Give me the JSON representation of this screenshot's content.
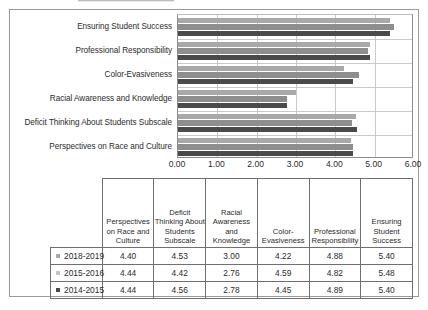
{
  "chart_data": {
    "type": "bar",
    "orientation": "horizontal",
    "title": "",
    "xlabel": "",
    "ylabel": "",
    "xlim": [
      0.0,
      6.0
    ],
    "xticks": [
      "0.00",
      "1.00",
      "2.00",
      "3.00",
      "4.00",
      "5.00",
      "6.00"
    ],
    "grid": true,
    "legend_position": "table-first-column",
    "categories": [
      "Perspectives on Race and Culture",
      "Deficit Thinking About Students Subscale",
      "Racial Awareness and Knowledge",
      "Color-Evasiveness",
      "Professional Responsibility",
      "Ensuring Student Success"
    ],
    "series": [
      {
        "name": "2018-2019",
        "color": "#a9a9a9",
        "values": [
          4.4,
          4.53,
          3.0,
          4.22,
          4.88,
          5.4
        ]
      },
      {
        "name": "2015-2016",
        "color": "#8e8e8e",
        "values": [
          4.44,
          4.42,
          2.76,
          4.59,
          4.82,
          5.48
        ]
      },
      {
        "name": "2014-2015",
        "color": "#4a4a4a",
        "values": [
          4.44,
          4.56,
          2.78,
          4.45,
          4.89,
          5.4
        ]
      }
    ]
  },
  "chart": {
    "category_labels": [
      "Ensuring Student Success",
      "Professional Responsibility",
      "Color-Evasiveness",
      "Racial Awareness and Knowledge",
      "Deficit Thinking About Students Subscale",
      "Perspectives on Race and Culture"
    ],
    "axis_ticks": [
      "0.00",
      "1.00",
      "2.00",
      "3.00",
      "4.00",
      "5.00",
      "6.00"
    ]
  },
  "table": {
    "corner_label": "",
    "headers": [
      "Perspectives on Race and Culture",
      "Deficit Thinking About Students Subscale",
      "Racial Awareness and Knowledge",
      "Color-Evasiveness",
      "Professional Responsibility",
      "Ensuring Student Success"
    ],
    "rows": [
      {
        "series": "2018-2019",
        "swatch": "#a9a9a9",
        "values": [
          "4.40",
          "4.53",
          "3.00",
          "4.22",
          "4.88",
          "5.40"
        ]
      },
      {
        "series": "2015-2016",
        "swatch": "#c4c4c4",
        "values": [
          "4.44",
          "4.42",
          "2.76",
          "4.59",
          "4.82",
          "5.48"
        ]
      },
      {
        "series": "2014-2015",
        "swatch": "#4a4a4a",
        "values": [
          "4.44",
          "4.56",
          "2.78",
          "4.45",
          "4.89",
          "5.40"
        ]
      }
    ]
  }
}
